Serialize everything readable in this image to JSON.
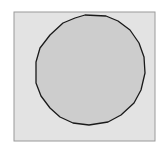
{
  "figure": {
    "width": 166,
    "height": 158,
    "background": "#ffffff",
    "frame": {
      "x": 14,
      "y": 12,
      "width": 141,
      "height": 129,
      "fill": "#e3e3e3",
      "stroke": "#9a9a9a"
    },
    "shape": {
      "type": "polygon-circle",
      "fill": "#cdcdcd",
      "stroke": "#1a1a1a",
      "points": "85,15 106,16 118,21 130,30 139,43 144,57 145,73 141,90 134,103 121,115 108,122 89,125 73,123 60,117 50,108 41,96 36,83 36,62 40,48 50,35 63,23 75,18"
    }
  }
}
